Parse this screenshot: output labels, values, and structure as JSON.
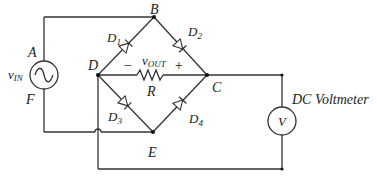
{
  "diagram": {
    "type": "bridge-rectifier-circuit",
    "nodes": {
      "A": {
        "label": "A"
      },
      "B": {
        "label": "B"
      },
      "C": {
        "label": "C"
      },
      "D": {
        "label": "D"
      },
      "E": {
        "label": "E"
      },
      "F": {
        "label": "F"
      }
    },
    "source": {
      "label_main": "v",
      "label_sub": "IN"
    },
    "diodes": [
      {
        "id": "D1",
        "label_main": "D",
        "label_sub": "1",
        "from": "D",
        "to": "B"
      },
      {
        "id": "D2",
        "label_main": "D",
        "label_sub": "2",
        "from": "B",
        "to": "C"
      },
      {
        "id": "D3",
        "label_main": "D",
        "label_sub": "3",
        "from": "D",
        "to": "E"
      },
      {
        "id": "D4",
        "label_main": "D",
        "label_sub": "4",
        "from": "E",
        "to": "C"
      }
    ],
    "resistor": {
      "label": "R",
      "vout_main": "v",
      "vout_sub": "OUT",
      "minus": "−",
      "plus": "+"
    },
    "voltmeter": {
      "symbol": "V",
      "label": "DC Voltmeter"
    }
  }
}
